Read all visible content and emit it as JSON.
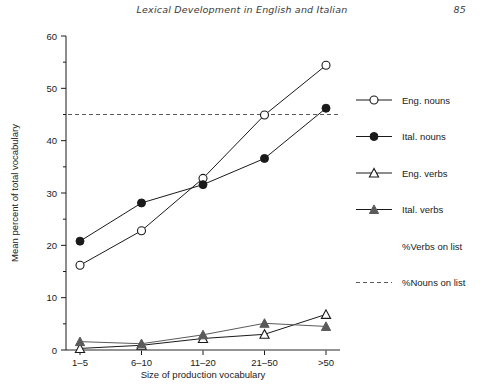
{
  "running_head": {
    "title": "Lexical Development in English and Italian",
    "page_number": "85"
  },
  "chart_data": {
    "type": "line",
    "title": "",
    "xlabel": "Size of production vocabulary",
    "ylabel": "Mean percent of total vocabulary",
    "categories": [
      "1–5",
      "6–10",
      "11–20",
      "21–50",
      ">50"
    ],
    "xlim": [
      0,
      4
    ],
    "ylim": [
      0,
      60
    ],
    "yticks": [
      0,
      10,
      20,
      30,
      40,
      50,
      60
    ],
    "ytick_labels": [
      "0",
      "10",
      "20",
      "30",
      "40",
      "50",
      "60"
    ],
    "yminor_ticks": [
      5,
      15,
      25,
      35,
      45,
      55
    ],
    "grid": false,
    "legend_position": "right",
    "series": [
      {
        "name": "Eng. nouns",
        "marker": "open-circle",
        "line_style": "solid",
        "color": "#1a1a1a",
        "values": [
          16.2,
          22.8,
          32.8,
          44.9,
          54.4
        ]
      },
      {
        "name": "Ital. nouns",
        "marker": "filled-circle",
        "line_style": "solid",
        "color": "#1a1a1a",
        "values": [
          20.8,
          28.1,
          31.6,
          36.6,
          46.2
        ]
      },
      {
        "name": "Eng. verbs",
        "marker": "open-triangle",
        "line_style": "solid",
        "color": "#1a1a1a",
        "values": [
          0.3,
          0.9,
          2.2,
          3.0,
          6.8
        ]
      },
      {
        "name": "Ital. verbs",
        "marker": "filled-triangle",
        "line_style": "solid",
        "color": "#5a5a5a",
        "values": [
          1.6,
          1.2,
          2.9,
          5.1,
          4.5
        ]
      }
    ],
    "reference_lines": [
      {
        "name": "%Verbs on list",
        "line_style": "solid",
        "color": "#9a9a9a",
        "value": 0.0,
        "legend_swatch": "none"
      },
      {
        "name": "%Nouns on list",
        "line_style": "dashed",
        "color": "#5a5a5a",
        "value": 45.0,
        "legend_swatch": "dashed"
      }
    ],
    "legend_entries": [
      {
        "label": "Eng. nouns",
        "marker": "open-circle",
        "swatch": "line"
      },
      {
        "label": "Ital. nouns",
        "marker": "filled-circle",
        "swatch": "line"
      },
      {
        "label": "Eng. verbs",
        "marker": "open-triangle",
        "swatch": "line"
      },
      {
        "label": "Ital. verbs",
        "marker": "filled-triangle",
        "swatch": "line"
      },
      {
        "label": "%Verbs on list",
        "marker": "none",
        "swatch": "none"
      },
      {
        "label": "%Nouns on list",
        "marker": "none",
        "swatch": "dashed"
      }
    ]
  }
}
